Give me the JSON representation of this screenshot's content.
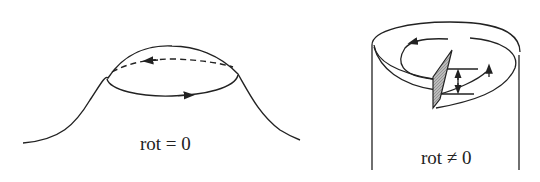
{
  "left_figure": {
    "label": "rot = 0",
    "description": "hill surface with closed loop path (irrotational)"
  },
  "right_figure": {
    "label": "rot ≠ 0",
    "description": "cylinder with spiral ramp path (rotational)"
  },
  "colors": {
    "stroke": "#222222",
    "hatch": "#999999"
  }
}
